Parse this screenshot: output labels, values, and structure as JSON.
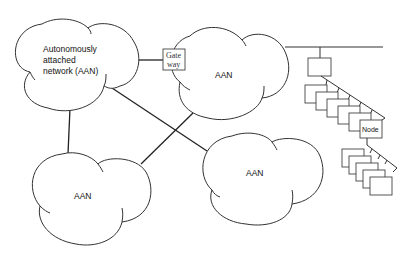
{
  "diagram": {
    "clouds": [
      {
        "id": "main",
        "lines": [
          "Autonomously",
          "attached",
          "network (AAN)"
        ]
      },
      {
        "id": "top-center",
        "label": "AAN"
      },
      {
        "id": "bottom-left",
        "label": "AAN"
      },
      {
        "id": "bottom-right",
        "label": "AAN"
      }
    ],
    "gateway": {
      "lines": [
        "Gate",
        "way"
      ]
    },
    "node": {
      "label": "Node"
    },
    "colors": {
      "stroke": "#333333",
      "background": "#ffffff"
    }
  }
}
